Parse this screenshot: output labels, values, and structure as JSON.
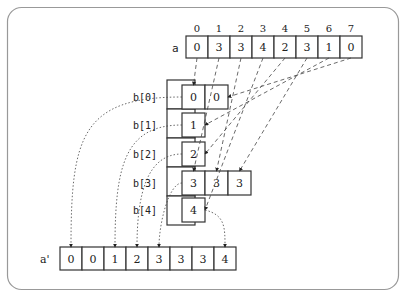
{
  "diagram": {
    "type": "bucket-sort",
    "input_array": {
      "label": "a",
      "indices": [
        "0",
        "1",
        "2",
        "3",
        "4",
        "5",
        "6",
        "7"
      ],
      "values": [
        "0",
        "3",
        "3",
        "4",
        "2",
        "3",
        "1",
        "0"
      ]
    },
    "buckets": [
      {
        "label": "b[0]",
        "values": [
          "0",
          "0"
        ]
      },
      {
        "label": "b[1]",
        "values": [
          "1"
        ]
      },
      {
        "label": "b[2]",
        "values": [
          "2"
        ]
      },
      {
        "label": "b[3]",
        "values": [
          "3",
          "3",
          "3"
        ]
      },
      {
        "label": "b[4]",
        "values": [
          "4"
        ]
      }
    ],
    "output_array": {
      "label": "a'",
      "values": [
        "0",
        "0",
        "1",
        "2",
        "3",
        "3",
        "3",
        "4"
      ]
    },
    "scatter_edges": [
      {
        "from_index": 0,
        "to_bucket": 0,
        "to_slot": 0
      },
      {
        "from_index": 7,
        "to_bucket": 0,
        "to_slot": 1
      },
      {
        "from_index": 6,
        "to_bucket": 1,
        "to_slot": 0
      },
      {
        "from_index": 4,
        "to_bucket": 2,
        "to_slot": 0
      },
      {
        "from_index": 1,
        "to_bucket": 3,
        "to_slot": 0
      },
      {
        "from_index": 2,
        "to_bucket": 3,
        "to_slot": 1
      },
      {
        "from_index": 5,
        "to_bucket": 3,
        "to_slot": 2
      },
      {
        "from_index": 3,
        "to_bucket": 4,
        "to_slot": 0
      }
    ],
    "gather_edges": [
      {
        "from_bucket": 0,
        "to_index": 0
      },
      {
        "from_bucket": 1,
        "to_index": 2
      },
      {
        "from_bucket": 2,
        "to_index": 3
      },
      {
        "from_bucket": 3,
        "to_index": 4
      },
      {
        "from_bucket": 4,
        "to_index": 7
      }
    ],
    "colors": {
      "stroke": "#333333",
      "frame": "#999999",
      "text": "#222222",
      "background": "#ffffff"
    }
  }
}
